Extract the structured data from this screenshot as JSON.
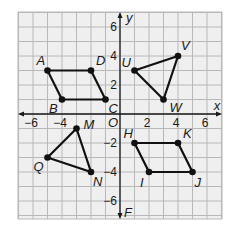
{
  "diagram": {
    "type": "coordinate-plane",
    "axes": {
      "x_label": "x",
      "y_label": "y",
      "y_bottom_label": "F",
      "origin_label": "O",
      "x_range": [
        -7,
        7
      ],
      "y_range": [
        -7,
        7
      ],
      "x_ticks": [
        {
          "value": -6,
          "label": "−6"
        },
        {
          "value": -4,
          "label": "−4"
        },
        {
          "value": 2,
          "label": "2"
        },
        {
          "value": 4,
          "label": "4"
        },
        {
          "value": 6,
          "label": "6"
        }
      ],
      "y_ticks": [
        {
          "value": 6,
          "label": "6"
        },
        {
          "value": 4,
          "label": "4"
        },
        {
          "value": 2,
          "label": "2"
        },
        {
          "value": -2,
          "label": "−2"
        },
        {
          "value": -4,
          "label": "−4"
        },
        {
          "value": -6,
          "label": "−6"
        }
      ]
    },
    "colors": {
      "grid_fill": "#efefef",
      "grid_line": "#b8b8b8",
      "axis": "#1a1a1a",
      "shape": "#111111"
    },
    "shapes": [
      {
        "name": "parallelogram-ABCD",
        "closed": true,
        "points": [
          {
            "label": "A",
            "x": -5,
            "y": 3,
            "lx": -11,
            "ly": -6
          },
          {
            "label": "D",
            "x": -2,
            "y": 3,
            "lx": 5,
            "ly": -6
          },
          {
            "label": "C",
            "x": -1,
            "y": 1,
            "lx": 3,
            "ly": 13
          },
          {
            "label": "B",
            "x": -4,
            "y": 1,
            "lx": -13,
            "ly": 13
          }
        ]
      },
      {
        "name": "triangle-UVW",
        "closed": true,
        "points": [
          {
            "label": "U",
            "x": 1,
            "y": 3,
            "lx": -13,
            "ly": -4
          },
          {
            "label": "V",
            "x": 4,
            "y": 4,
            "lx": 3,
            "ly": -6
          },
          {
            "label": "W",
            "x": 3,
            "y": 1,
            "lx": 6,
            "ly": 12
          }
        ]
      },
      {
        "name": "triangle-MNQ",
        "closed": true,
        "points": [
          {
            "label": "M",
            "x": -3,
            "y": -1,
            "lx": 7,
            "ly": 0
          },
          {
            "label": "N",
            "x": -2,
            "y": -4,
            "lx": 2,
            "ly": 14
          },
          {
            "label": "Q",
            "x": -5,
            "y": -3,
            "lx": -14,
            "ly": 13
          }
        ]
      },
      {
        "name": "parallelogram-HKJI",
        "closed": true,
        "points": [
          {
            "label": "H",
            "x": 1,
            "y": -2,
            "lx": -11,
            "ly": -5
          },
          {
            "label": "K",
            "x": 4,
            "y": -2,
            "lx": 5,
            "ly": -5
          },
          {
            "label": "J",
            "x": 5,
            "y": -4,
            "lx": 2,
            "ly": 15
          },
          {
            "label": "I",
            "x": 2,
            "y": -4,
            "lx": -9,
            "ly": 15
          }
        ]
      }
    ]
  }
}
